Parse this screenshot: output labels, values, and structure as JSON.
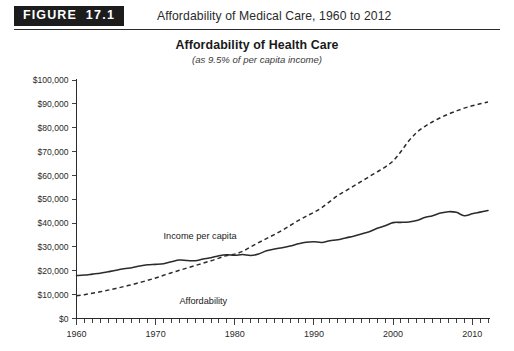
{
  "figure": {
    "badge_word": "FIGURE",
    "badge_number": "17.1",
    "caption": "Affordability of Medical Care, 1960 to 2012"
  },
  "chart_data": {
    "type": "line",
    "title": "Affordability of Health Care",
    "subtitle": "(as 9.5% of per capita income)",
    "xlabel": "",
    "ylabel": "",
    "xlim": [
      1960,
      2012
    ],
    "ylim": [
      0,
      100000
    ],
    "grid": false,
    "legend_position": "inline-annotation",
    "y_ticks": [
      0,
      10000,
      20000,
      30000,
      40000,
      50000,
      60000,
      70000,
      80000,
      90000,
      100000
    ],
    "y_tick_labels": [
      "$0",
      "$10,000",
      "$20,000",
      "$30,000",
      "$40,000",
      "$50,000",
      "$60,000",
      "$70,000",
      "$80,000",
      "$90,000",
      "$100,000"
    ],
    "x_ticks": [
      1960,
      1970,
      1980,
      1990,
      2000,
      2010
    ],
    "x_tick_labels": [
      "1960",
      "1970",
      "1980",
      "1990",
      "2000",
      "2010"
    ],
    "x_minor_tick_step": 1,
    "x": [
      1960,
      1961,
      1962,
      1963,
      1964,
      1965,
      1966,
      1967,
      1968,
      1969,
      1970,
      1971,
      1972,
      1973,
      1974,
      1975,
      1976,
      1977,
      1978,
      1979,
      1980,
      1981,
      1982,
      1983,
      1984,
      1985,
      1986,
      1987,
      1988,
      1989,
      1990,
      1991,
      1992,
      1993,
      1994,
      1995,
      1996,
      1997,
      1998,
      1999,
      2000,
      2001,
      2002,
      2003,
      2004,
      2005,
      2006,
      2007,
      2008,
      2009,
      2010,
      2011,
      2012
    ],
    "series": [
      {
        "name": "Income per capita",
        "style": "solid",
        "color": "#2b2b2b",
        "values": [
          18000,
          18200,
          18600,
          19000,
          19600,
          20200,
          20900,
          21300,
          22000,
          22500,
          22700,
          23000,
          23800,
          24500,
          24300,
          24200,
          24900,
          25500,
          26300,
          26700,
          26500,
          26800,
          26400,
          27000,
          28400,
          29100,
          29700,
          30400,
          31300,
          32000,
          32200,
          31900,
          32600,
          33000,
          33800,
          34500,
          35400,
          36400,
          37800,
          38900,
          40200,
          40300,
          40500,
          41100,
          42300,
          43100,
          44200,
          44800,
          44500,
          43100,
          43900,
          44600,
          45300
        ]
      },
      {
        "name": "Affordability",
        "style": "dashed",
        "color": "#2b2b2b",
        "values": [
          9500,
          10000,
          10600,
          11200,
          11900,
          12600,
          13400,
          14200,
          15100,
          16000,
          17000,
          18100,
          19200,
          20200,
          21200,
          22200,
          23200,
          24200,
          25300,
          26400,
          27000,
          28200,
          30000,
          31800,
          33500,
          35200,
          37000,
          39000,
          41000,
          42800,
          44500,
          46500,
          49000,
          51500,
          53500,
          55500,
          57500,
          59500,
          61500,
          63500,
          66000,
          70000,
          74500,
          78000,
          80500,
          82500,
          84200,
          85700,
          87000,
          88200,
          89200,
          90000,
          90800
        ]
      }
    ],
    "annotations": [
      {
        "text": "Income per capita",
        "x": 1971,
        "y": 33500
      },
      {
        "text": "Affordability",
        "x": 1973,
        "y": 6200
      }
    ]
  }
}
